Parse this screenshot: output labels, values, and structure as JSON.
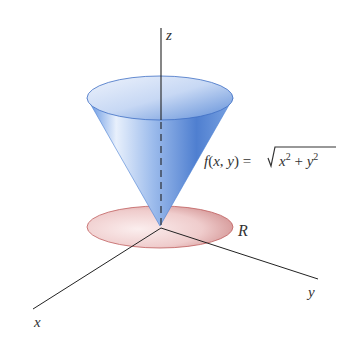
{
  "figure": {
    "axes": {
      "x_label": "x",
      "y_label": "y",
      "z_label": "z"
    },
    "surface": {
      "name": "cone",
      "equation_lhs": "f(x, y) = ",
      "equation_radicand_parts": [
        "x",
        "2",
        " + ",
        "y",
        "2"
      ],
      "color": "#4a7fd4"
    },
    "region": {
      "label": "R",
      "shape": "disk",
      "color": "#c86a6a"
    }
  }
}
